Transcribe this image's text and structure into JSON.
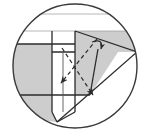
{
  "figure": {
    "kind": "line-diagram",
    "canvas": {
      "width": 150,
      "height": 137
    },
    "colors": {
      "background": "#ffffff",
      "stroke_dark": "#2b2b2b",
      "stroke_medium": "#555555",
      "stroke_light": "#9a9a9a",
      "fill_shade_light": "#d4d4d4",
      "fill_shade_mid": "#c9c9c9",
      "fill_white": "#ffffff",
      "circle_outline": "#3a3a3a"
    },
    "clip_circle": {
      "cx": 75,
      "cy": 66,
      "r": 62
    },
    "regions": [
      {
        "name": "upper-right-shaded-wedge",
        "fill": "#cdcdcd",
        "points": "63,31 137,31 137,52 118,52 90,95 63,95"
      },
      {
        "name": "left-shaded-band",
        "fill": "#cdcdcd",
        "points": "10,44 63,44 63,95 10,95"
      },
      {
        "name": "lower-left-shaded-wedge",
        "fill": "#cdcdcd",
        "points": "10,95 63,95 57,122 20,118"
      },
      {
        "name": "inner-vertical-band",
        "fill": "#ffffff",
        "points": "52,31 75,31 75,112 57,122 52,112"
      },
      {
        "name": "top-white-square",
        "fill": "#ffffff",
        "points": "52,31 75,31 75,52 52,52"
      }
    ],
    "lines": [
      {
        "name": "top-faint-chord",
        "shade": "light",
        "x1": 22,
        "y1": 14,
        "x2": 129,
        "y2": 14
      },
      {
        "name": "upper-horizontal-rule",
        "shade": "light",
        "x1": 16,
        "y1": 31,
        "x2": 137,
        "y2": 31
      },
      {
        "name": "mid-horizontal-rule",
        "shade": "dark",
        "x1": 12,
        "y1": 44,
        "x2": 75,
        "y2": 44
      },
      {
        "name": "lower-horizontal-rule",
        "shade": "dark",
        "x1": 12,
        "y1": 95,
        "x2": 90,
        "y2": 95
      },
      {
        "name": "band-left-edge",
        "shade": "dark",
        "x1": 52,
        "y1": 31,
        "x2": 52,
        "y2": 112
      },
      {
        "name": "band-right-edge",
        "shade": "dark",
        "x1": 75,
        "y1": 31,
        "x2": 75,
        "y2": 112
      },
      {
        "name": "band-tip-left",
        "shade": "dark",
        "x1": 52,
        "y1": 112,
        "x2": 57,
        "y2": 122
      },
      {
        "name": "band-tip-right",
        "shade": "dark",
        "x1": 75,
        "y1": 112,
        "x2": 57,
        "y2": 122
      },
      {
        "name": "square-bottom-edge",
        "shade": "dark",
        "x1": 52,
        "y1": 52,
        "x2": 75,
        "y2": 52
      },
      {
        "name": "diagonal-cut-upper",
        "shade": "dark",
        "x1": 75,
        "y1": 31,
        "x2": 137,
        "y2": 52
      },
      {
        "name": "diagonal-cut-lower",
        "shade": "dark",
        "x1": 57,
        "y1": 122,
        "x2": 137,
        "y2": 52
      },
      {
        "name": "wedge-inner-edge",
        "shade": "dark",
        "x1": 90,
        "y1": 95,
        "x2": 98,
        "y2": 49
      },
      {
        "name": "band-left-boundary-lower",
        "shade": "medium",
        "x1": 63,
        "y1": 52,
        "x2": 63,
        "y2": 112
      }
    ],
    "dashed_arrows": [
      {
        "name": "incident-ray-arrow",
        "from": {
          "x": 97,
          "y": 39
        },
        "to": {
          "x": 61,
          "y": 83
        },
        "dash": "4 3",
        "arrowhead": "to"
      },
      {
        "name": "reflected-ray-arrow",
        "from": {
          "x": 62,
          "y": 48
        },
        "to": {
          "x": 93,
          "y": 95
        },
        "dash": "4 3",
        "arrowhead": "to"
      }
    ],
    "solid_arrows": [
      {
        "name": "curved-return-arrow",
        "path": "M 92 42 Q 104 38 101 49",
        "arrowhead": "to"
      }
    ],
    "markers": [
      {
        "name": "crossing-point",
        "x": 79,
        "y": 61
      }
    ]
  }
}
